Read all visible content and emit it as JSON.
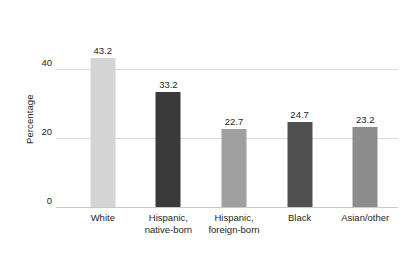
{
  "chart_data": {
    "type": "bar",
    "title": "",
    "xlabel": "",
    "ylabel": "Percentage",
    "categories": [
      "White",
      "Hispanic, native-born",
      "Hispanic, foreign-born",
      "Black",
      "Asian/other"
    ],
    "category_lines": [
      [
        "White"
      ],
      [
        "Hispanic,",
        "native-born"
      ],
      [
        "Hispanic,",
        "foreign-born"
      ],
      [
        "Black"
      ],
      [
        "Asian/other"
      ]
    ],
    "values": [
      43.2,
      33.2,
      22.7,
      24.7,
      23.2
    ],
    "value_labels": [
      "43.2",
      "33.2",
      "22.7",
      "24.7",
      "23.2"
    ],
    "bar_colors": [
      "#d4d4d4",
      "#3a3a3a",
      "#a0a0a0",
      "#505050",
      "#8c8c8c"
    ],
    "ylim": [
      0,
      48.4
    ],
    "yticks": [
      0,
      20,
      40
    ],
    "ytick_labels": [
      "0",
      "20",
      "40"
    ],
    "grid": true,
    "gridlines_at": [
      20,
      40
    ],
    "grid_color": "#d9d9d9",
    "axis_color": "#c9c9c9",
    "legend": null,
    "background": "#ffffff"
  },
  "axis": {
    "y_title": "Percentage"
  }
}
